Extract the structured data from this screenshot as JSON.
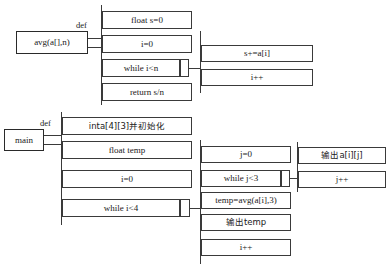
{
  "diagram": {
    "type": "pad-flowchart",
    "title": "",
    "procedures": [
      {
        "name_box": "avg(a[],n)",
        "def_label": "def",
        "body": [
          "float s=0",
          "i=0",
          "while i<n",
          "return s/n"
        ],
        "loop_body": [
          "s+=a[i]",
          "i++"
        ]
      },
      {
        "name_box": "main",
        "def_label": "def",
        "body": [
          "inta[4][3]并初始化",
          "float temp",
          "i=0",
          "while i<4"
        ],
        "loop_body": [
          "j=0",
          "while j<3",
          "temp=avg(a[i],3)",
          "输出temp",
          "i++"
        ],
        "inner_loop_body": [
          "输出a[i][j]",
          "j++"
        ]
      }
    ],
    "colors": {
      "stroke": "#3a3a3a",
      "text": "#1a1a1a",
      "background": "#ffffff"
    }
  }
}
